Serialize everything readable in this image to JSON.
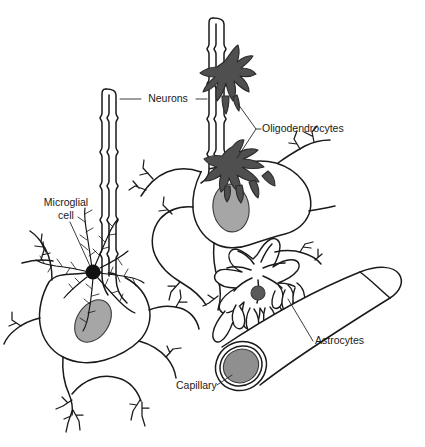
{
  "figure": {
    "background_color": "#ffffff",
    "width": 425,
    "height": 447
  },
  "palette": {
    "ink": "#1a1a1a",
    "leader_line": "#262626",
    "nucleus_gray": "#a6a6a6",
    "oligodendrocyte_gray": "#4f4f4f",
    "astrocyte_nucleus_gray": "#5a5a5a",
    "capillary_lumen_gray": "#8f8f8f",
    "cell_fill": "#ffffff"
  },
  "labels": [
    {
      "id": "neurons",
      "name": "Neurons",
      "text": "Neurons",
      "x": 168,
      "y": 99,
      "anchor": "middle",
      "lines": [
        "Neurons"
      ]
    },
    {
      "id": "oligodendrocytes",
      "name": "Oligodendrocytes",
      "text": "Oligodendrocytes",
      "x": 262,
      "y": 129,
      "anchor": "start",
      "lines": [
        "Oligodendrocytes"
      ]
    },
    {
      "id": "microglial-cell",
      "name": "Microglial cell",
      "text": "Microglial cell",
      "x": 66,
      "y": 203,
      "anchor": "middle",
      "lines": [
        "Microglial",
        "cell"
      ]
    },
    {
      "id": "astrocytes",
      "name": "Astrocytes",
      "text": "Astrocytes",
      "x": 315,
      "y": 341,
      "anchor": "start",
      "lines": [
        "Astrocytes"
      ]
    },
    {
      "id": "capillary",
      "name": "Capillary",
      "text": "Capillary",
      "x": 176,
      "y": 386,
      "anchor": "start",
      "lines": [
        "Capillary"
      ]
    }
  ],
  "structures": [
    {
      "id": "neuron-left",
      "name": "Left neuron cell body",
      "kind": "neuron"
    },
    {
      "id": "neuron-right",
      "name": "Right neuron cell body",
      "kind": "neuron"
    },
    {
      "id": "axon-left",
      "name": "Left myelinated axon",
      "kind": "axon",
      "myelin_segments": 5
    },
    {
      "id": "axon-right",
      "name": "Right myelinated axon",
      "kind": "axon",
      "myelin_segments": 5
    },
    {
      "id": "oligodendrocyte-upper",
      "name": "Upper oligodendrocyte",
      "kind": "oligodendrocyte"
    },
    {
      "id": "oligodendrocyte-lower",
      "name": "Lower oligodendrocyte",
      "kind": "oligodendrocyte"
    },
    {
      "id": "microglial-cell",
      "name": "Microglial cell",
      "kind": "microglia"
    },
    {
      "id": "astrocyte",
      "name": "Astrocyte",
      "kind": "astrocyte"
    },
    {
      "id": "capillary",
      "name": "Capillary blood vessel",
      "kind": "capillary"
    }
  ]
}
